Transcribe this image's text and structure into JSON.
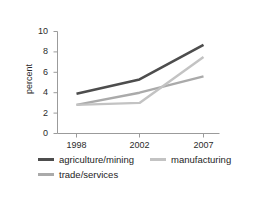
{
  "figure": {
    "top_clipped_text": "",
    "background": "#ffffff"
  },
  "axis": {
    "ylabel": "percent",
    "yticks": [
      "0",
      "2",
      "4",
      "6",
      "8",
      "10"
    ],
    "xticks": [
      "1998",
      "2002",
      "2007"
    ],
    "axis_color": "#9b9b9b",
    "text_color": "#2b2b2b"
  },
  "legend": {
    "entries": [
      {
        "label": "agriculture/mining",
        "color": "#4d4d4d",
        "swatch_height": 3
      },
      {
        "label": "manufacturing",
        "color": "#c3c3c3",
        "swatch_height": 3
      },
      {
        "label": "trade/services",
        "color": "#aaaaaa",
        "swatch_height": 3
      }
    ]
  },
  "chart_data": {
    "type": "line",
    "title": "",
    "xlabel": "",
    "ylabel": "percent",
    "x": [
      "1998",
      "2002",
      "2007"
    ],
    "categories": [
      "1998",
      "2002",
      "2007"
    ],
    "ylim": [
      0,
      10
    ],
    "yticks": [
      0,
      2,
      4,
      6,
      8,
      10
    ],
    "grid": false,
    "legend_position": "bottom-left",
    "series": [
      {
        "name": "agriculture/mining",
        "color": "#4d4d4d",
        "width": 2.6,
        "values": [
          3.9,
          5.3,
          8.7
        ]
      },
      {
        "name": "manufacturing",
        "color": "#c3c3c3",
        "width": 2.4,
        "values": [
          2.8,
          3.0,
          7.5
        ]
      },
      {
        "name": "trade/services",
        "color": "#aaaaaa",
        "width": 2.4,
        "values": [
          2.8,
          4.0,
          5.6
        ]
      }
    ]
  }
}
